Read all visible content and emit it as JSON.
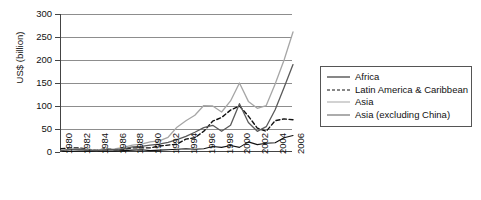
{
  "chart_data": {
    "type": "line",
    "title": "",
    "xlabel": "",
    "ylabel": "US$ (billion)",
    "ylim": [
      0,
      300
    ],
    "ytick_values": [
      0,
      50,
      100,
      150,
      200,
      250,
      300
    ],
    "ytick_labels": [
      "0",
      "50",
      "100",
      "150",
      "200",
      "250",
      "300"
    ],
    "grid": true,
    "legend_position": "right",
    "x": [
      1980,
      1981,
      1982,
      1983,
      1984,
      1985,
      1986,
      1987,
      1988,
      1989,
      1990,
      1991,
      1992,
      1993,
      1994,
      1995,
      1996,
      1997,
      1998,
      1999,
      2000,
      2001,
      2002,
      2003,
      2004,
      2005,
      2006
    ],
    "xtick_labels": [
      "1980",
      "1982",
      "1984",
      "1986",
      "1988",
      "1990",
      "1992",
      "1994",
      "1996",
      "1998",
      "2000",
      "2002",
      "2004",
      "2006"
    ],
    "series": [
      {
        "name": "Africa",
        "style": "solid",
        "color": "#111111",
        "width": 1.1,
        "values": [
          1,
          1,
          2,
          2,
          2,
          2,
          2,
          3,
          4,
          5,
          3,
          4,
          5,
          6,
          7,
          6,
          7,
          12,
          10,
          14,
          10,
          22,
          16,
          19,
          20,
          31,
          36
        ]
      },
      {
        "name": "Latin America & Caribbean",
        "style": "dashed",
        "color": "#111111",
        "width": 1.4,
        "values": [
          7,
          9,
          9,
          6,
          4,
          7,
          5,
          6,
          9,
          9,
          9,
          13,
          15,
          17,
          28,
          31,
          45,
          67,
          75,
          91,
          100,
          78,
          52,
          45,
          68,
          72,
          70
        ]
      },
      {
        "name": "Asia",
        "style": "solid",
        "color": "#a6a6a6",
        "width": 1.3,
        "values": [
          3,
          6,
          7,
          5,
          4,
          6,
          7,
          10,
          15,
          17,
          22,
          24,
          32,
          54,
          68,
          80,
          101,
          100,
          87,
          111,
          150,
          110,
          95,
          101,
          148,
          200,
          261
        ]
      },
      {
        "name": "Asia (excluding China)",
        "style": "solid",
        "color": "#5a5a5a",
        "width": 1.3,
        "values": [
          3,
          5,
          6,
          4,
          3,
          5,
          5,
          7,
          11,
          12,
          15,
          17,
          21,
          27,
          34,
          43,
          53,
          58,
          45,
          58,
          105,
          64,
          45,
          55,
          92,
          140,
          190
        ]
      }
    ]
  },
  "legend": {
    "items": [
      {
        "label": "Africa",
        "icon": "solid-line-icon"
      },
      {
        "label": "Latin America & Caribbean",
        "icon": "dashed-line-icon"
      },
      {
        "label": "Asia",
        "icon": "solid-line-icon"
      },
      {
        "label": "Asia (excluding China)",
        "icon": "solid-line-icon"
      }
    ]
  }
}
